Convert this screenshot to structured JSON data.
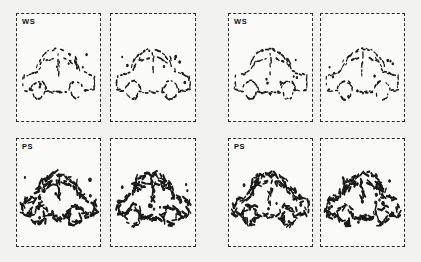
{
  "figure": {
    "background_color": "#f2f2f0",
    "panel_fill": "#fbfbfa",
    "ink_color": "#1a1a1a",
    "border_color": "#2b2b2b",
    "border_style": "dashed"
  },
  "groups": [
    {
      "name": "left-group",
      "panels": [
        {
          "id": "left-ws-a",
          "label": "WS",
          "x": 16,
          "y": 13,
          "w": 85,
          "h": 109,
          "stimulus": "car",
          "variant": "ws-a"
        },
        {
          "id": "left-ws-b",
          "label": "",
          "x": 110,
          "y": 13,
          "w": 86,
          "h": 109,
          "stimulus": "car",
          "variant": "ws-b"
        },
        {
          "id": "left-ps-a",
          "label": "PS",
          "x": 16,
          "y": 138,
          "w": 85,
          "h": 109,
          "stimulus": "car",
          "variant": "ps-a"
        },
        {
          "id": "left-ps-b",
          "label": "",
          "x": 110,
          "y": 138,
          "w": 86,
          "h": 109,
          "stimulus": "car",
          "variant": "ps-b"
        }
      ]
    },
    {
      "name": "right-group",
      "panels": [
        {
          "id": "right-ws-a",
          "label": "WS",
          "x": 228,
          "y": 13,
          "w": 85,
          "h": 109,
          "stimulus": "car",
          "variant": "ws-c"
        },
        {
          "id": "right-ws-b",
          "label": "",
          "x": 320,
          "y": 13,
          "w": 85,
          "h": 109,
          "stimulus": "car-mirrored",
          "variant": "ws-d"
        },
        {
          "id": "right-ps-a",
          "label": "PS",
          "x": 228,
          "y": 138,
          "w": 85,
          "h": 109,
          "stimulus": "car",
          "variant": "ps-c"
        },
        {
          "id": "right-ps-b",
          "label": "",
          "x": 320,
          "y": 138,
          "w": 85,
          "h": 109,
          "stimulus": "car-mirrored",
          "variant": "ps-d"
        }
      ]
    }
  ],
  "labels": {
    "ws": "WS",
    "ps": "PS"
  }
}
